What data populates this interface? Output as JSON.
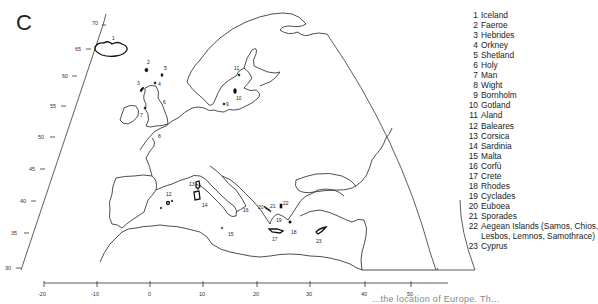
{
  "figure": {
    "panel_letter": "C",
    "caption_fragment": "...the location of Europe. Th..."
  },
  "axes": {
    "latitude_ticks": [
      "70",
      "65",
      "60",
      "55",
      "50",
      "45",
      "40",
      "35",
      "30"
    ],
    "longitude_ticks": [
      "-20",
      "-10",
      "0",
      "10",
      "20",
      "30",
      "40",
      "50"
    ]
  },
  "islands": [
    {
      "num": "1",
      "name": "Iceland"
    },
    {
      "num": "2",
      "name": "Faeroe"
    },
    {
      "num": "3",
      "name": "Hebrides"
    },
    {
      "num": "4",
      "name": "Orkney"
    },
    {
      "num": "5",
      "name": "Shetland"
    },
    {
      "num": "6",
      "name": "Holy"
    },
    {
      "num": "7",
      "name": "Man"
    },
    {
      "num": "8",
      "name": "Wight"
    },
    {
      "num": "9",
      "name": "Bornholm"
    },
    {
      "num": "10",
      "name": "Gotland"
    },
    {
      "num": "11",
      "name": "Aland"
    },
    {
      "num": "12",
      "name": "Baleares"
    },
    {
      "num": "13",
      "name": "Corsica"
    },
    {
      "num": "14",
      "name": "Sardinia"
    },
    {
      "num": "15",
      "name": "Malta"
    },
    {
      "num": "16",
      "name": "Corfù"
    },
    {
      "num": "17",
      "name": "Crete"
    },
    {
      "num": "18",
      "name": "Rhodes"
    },
    {
      "num": "19",
      "name": "Cyclades"
    },
    {
      "num": "20",
      "name": "Euboea"
    },
    {
      "num": "21",
      "name": "Sporades"
    },
    {
      "num": "22",
      "name": "Aegean Islands (Samos, Chios,",
      "continuation": "Lesbos, Lemnos, Samothrace)"
    },
    {
      "num": "23",
      "name": "Cyprus"
    }
  ]
}
